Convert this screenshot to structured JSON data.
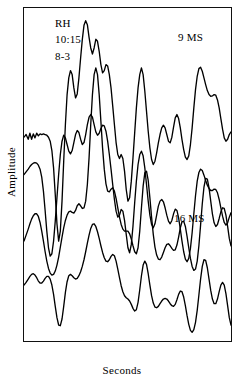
{
  "figure": {
    "background_color": "#ffffff",
    "line_color": "#000000",
    "axis_color": "#111111"
  },
  "annotations": {
    "subject": "RH",
    "time": "10:15",
    "code": "8-3",
    "group_1_label": "9 MS",
    "group_2_label": "16 MS"
  },
  "axes": {
    "xlabel": "Seconds",
    "ylabel": "Amplitude",
    "xticklabels": [
      "0.1",
      "0.2",
      "0.3",
      "0.4"
    ],
    "xtickvalues": [
      0.1,
      0.2,
      0.3,
      0.4
    ]
  },
  "chart_data": {
    "type": "line",
    "title": "",
    "subtitle": "",
    "xlabel": "Seconds",
    "ylabel": "Amplitude",
    "xlim": [
      0.0,
      0.49
    ],
    "ylim": [
      0,
      1
    ],
    "grid": false,
    "legend_position": "none",
    "annotations": [
      {
        "text": "RH",
        "x": 0.02,
        "y": 0.98
      },
      {
        "text": "10:15",
        "x": 0.02,
        "y": 0.93
      },
      {
        "text": "8-3",
        "x": 0.02,
        "y": 0.88
      },
      {
        "text": "9 MS",
        "x": 0.32,
        "y": 0.95
      },
      {
        "text": "16 MS",
        "x": 0.31,
        "y": 0.42
      }
    ],
    "axis_ranges": {
      "x": [
        0.0,
        0.49
      ],
      "y_arbitrary_units": true
    },
    "series": [
      {
        "name": "9 MS upper trace",
        "group": "9 MS",
        "x": [
          0.0,
          0.005,
          0.01,
          0.014,
          0.018,
          0.022,
          0.026,
          0.03,
          0.034,
          0.038,
          0.042,
          0.046,
          0.05,
          0.054,
          0.058,
          0.062,
          0.066,
          0.07,
          0.074,
          0.078,
          0.082,
          0.086,
          0.09,
          0.094,
          0.098,
          0.102,
          0.106,
          0.11,
          0.114,
          0.118,
          0.122,
          0.126,
          0.13,
          0.134,
          0.138,
          0.142,
          0.146,
          0.15,
          0.154,
          0.158,
          0.162,
          0.166,
          0.17,
          0.174,
          0.178,
          0.182,
          0.186,
          0.19,
          0.194,
          0.198,
          0.202,
          0.206,
          0.21,
          0.214,
          0.218,
          0.222,
          0.226,
          0.23,
          0.234,
          0.238,
          0.242,
          0.246,
          0.25,
          0.254,
          0.258,
          0.262,
          0.266,
          0.27,
          0.274,
          0.278,
          0.282,
          0.286,
          0.29,
          0.294,
          0.298,
          0.302,
          0.306,
          0.31,
          0.314,
          0.318,
          0.322,
          0.326,
          0.33,
          0.334,
          0.338,
          0.342,
          0.346,
          0.35,
          0.354,
          0.358,
          0.362,
          0.366,
          0.37,
          0.374,
          0.378,
          0.382,
          0.386,
          0.39,
          0.394,
          0.398,
          0.402,
          0.406,
          0.41,
          0.414,
          0.418,
          0.422,
          0.426,
          0.43,
          0.434,
          0.438,
          0.442,
          0.446,
          0.45,
          0.454,
          0.458,
          0.462,
          0.466,
          0.47,
          0.474,
          0.478,
          0.482,
          0.486,
          0.49
        ],
        "y": [
          0.612,
          0.62,
          0.606,
          0.624,
          0.606,
          0.622,
          0.61,
          0.624,
          0.616,
          0.622,
          0.62,
          0.622,
          0.62,
          0.618,
          0.612,
          0.6,
          0.572,
          0.52,
          0.44,
          0.352,
          0.3,
          0.33,
          0.42,
          0.54,
          0.65,
          0.74,
          0.79,
          0.812,
          0.8,
          0.76,
          0.73,
          0.742,
          0.79,
          0.85,
          0.905,
          0.948,
          0.962,
          0.95,
          0.912,
          0.88,
          0.862,
          0.88,
          0.906,
          0.9,
          0.87,
          0.83,
          0.805,
          0.812,
          0.83,
          0.826,
          0.8,
          0.76,
          0.706,
          0.65,
          0.596,
          0.56,
          0.548,
          0.56,
          0.548,
          0.51,
          0.455,
          0.42,
          0.43,
          0.48,
          0.55,
          0.625,
          0.7,
          0.76,
          0.8,
          0.82,
          0.8,
          0.75,
          0.69,
          0.63,
          0.58,
          0.545,
          0.53,
          0.54,
          0.565,
          0.595,
          0.62,
          0.64,
          0.648,
          0.64,
          0.62,
          0.6,
          0.595,
          0.612,
          0.642,
          0.67,
          0.68,
          0.668,
          0.64,
          0.605,
          0.575,
          0.552,
          0.545,
          0.556,
          0.59,
          0.64,
          0.7,
          0.755,
          0.795,
          0.818,
          0.822,
          0.81,
          0.79,
          0.77,
          0.752,
          0.74,
          0.735,
          0.736,
          0.74,
          0.738,
          0.724,
          0.7,
          0.668,
          0.636,
          0.61,
          0.6,
          0.606,
          0.62,
          0.628
        ]
      },
      {
        "name": "9 MS lower trace",
        "group": "9 MS",
        "x": [
          0.0,
          0.005,
          0.01,
          0.014,
          0.018,
          0.022,
          0.026,
          0.03,
          0.034,
          0.038,
          0.042,
          0.046,
          0.05,
          0.054,
          0.058,
          0.062,
          0.066,
          0.07,
          0.074,
          0.078,
          0.082,
          0.086,
          0.09,
          0.094,
          0.098,
          0.102,
          0.106,
          0.11,
          0.114,
          0.118,
          0.122,
          0.126,
          0.13,
          0.134,
          0.138,
          0.142,
          0.146,
          0.15,
          0.154,
          0.158,
          0.162,
          0.166,
          0.17,
          0.174,
          0.178,
          0.182,
          0.186,
          0.19,
          0.194,
          0.198,
          0.202,
          0.206,
          0.21,
          0.214,
          0.218,
          0.222,
          0.226,
          0.23,
          0.234,
          0.238,
          0.242,
          0.246,
          0.25,
          0.254,
          0.258,
          0.262,
          0.266,
          0.27,
          0.274,
          0.278,
          0.282,
          0.286,
          0.29,
          0.294,
          0.298,
          0.302,
          0.306,
          0.31,
          0.314,
          0.318,
          0.322,
          0.326,
          0.33,
          0.334,
          0.338,
          0.342,
          0.346,
          0.35,
          0.354,
          0.358,
          0.362,
          0.366,
          0.37,
          0.374,
          0.378,
          0.382,
          0.386,
          0.39,
          0.394,
          0.398,
          0.402,
          0.406,
          0.41,
          0.414,
          0.418,
          0.422,
          0.426,
          0.43,
          0.434,
          0.438,
          0.442,
          0.446,
          0.45,
          0.454,
          0.458,
          0.462,
          0.466,
          0.47,
          0.474,
          0.478,
          0.482,
          0.486,
          0.49
        ],
        "y": [
          0.5,
          0.508,
          0.516,
          0.524,
          0.53,
          0.534,
          0.536,
          0.534,
          0.528,
          0.516,
          0.492,
          0.45,
          0.392,
          0.33,
          0.28,
          0.255,
          0.262,
          0.3,
          0.36,
          0.43,
          0.5,
          0.56,
          0.6,
          0.618,
          0.61,
          0.59,
          0.57,
          0.562,
          0.572,
          0.596,
          0.62,
          0.632,
          0.626,
          0.606,
          0.59,
          0.596,
          0.62,
          0.65,
          0.672,
          0.68,
          0.672,
          0.65,
          0.628,
          0.618,
          0.624,
          0.638,
          0.648,
          0.646,
          0.63,
          0.6,
          0.56,
          0.516,
          0.47,
          0.425,
          0.39,
          0.372,
          0.378,
          0.395,
          0.39,
          0.362,
          0.32,
          0.28,
          0.265,
          0.29,
          0.345,
          0.415,
          0.48,
          0.53,
          0.56,
          0.57,
          0.556,
          0.52,
          0.47,
          0.42,
          0.378,
          0.35,
          0.34,
          0.352,
          0.378,
          0.405,
          0.42,
          0.425,
          0.418,
          0.4,
          0.378,
          0.36,
          0.352,
          0.362,
          0.382,
          0.396,
          0.392,
          0.37,
          0.336,
          0.3,
          0.268,
          0.246,
          0.238,
          0.248,
          0.278,
          0.325,
          0.382,
          0.436,
          0.48,
          0.506,
          0.516,
          0.512,
          0.498,
          0.482,
          0.468,
          0.458,
          0.452,
          0.452,
          0.456,
          0.455,
          0.445,
          0.425,
          0.4,
          0.375,
          0.356,
          0.348,
          0.355,
          0.372,
          0.385
        ]
      },
      {
        "name": "16 MS upper trace",
        "group": "16 MS",
        "x": [
          0.0,
          0.005,
          0.01,
          0.014,
          0.018,
          0.022,
          0.026,
          0.03,
          0.034,
          0.038,
          0.042,
          0.046,
          0.05,
          0.054,
          0.058,
          0.062,
          0.066,
          0.07,
          0.074,
          0.078,
          0.082,
          0.086,
          0.09,
          0.094,
          0.098,
          0.102,
          0.106,
          0.11,
          0.114,
          0.118,
          0.122,
          0.126,
          0.13,
          0.134,
          0.138,
          0.142,
          0.146,
          0.15,
          0.154,
          0.158,
          0.162,
          0.166,
          0.17,
          0.174,
          0.178,
          0.182,
          0.186,
          0.19,
          0.194,
          0.198,
          0.202,
          0.206,
          0.21,
          0.214,
          0.218,
          0.222,
          0.226,
          0.23,
          0.234,
          0.238,
          0.242,
          0.246,
          0.25,
          0.254,
          0.258,
          0.262,
          0.266,
          0.27,
          0.274,
          0.278,
          0.282,
          0.286,
          0.29,
          0.294,
          0.298,
          0.302,
          0.306,
          0.31,
          0.314,
          0.318,
          0.322,
          0.326,
          0.33,
          0.334,
          0.338,
          0.342,
          0.346,
          0.35,
          0.354,
          0.358,
          0.362,
          0.366,
          0.37,
          0.374,
          0.378,
          0.382,
          0.386,
          0.39,
          0.394,
          0.398,
          0.402,
          0.406,
          0.41,
          0.414,
          0.418,
          0.422,
          0.426,
          0.43,
          0.434,
          0.438,
          0.442,
          0.446,
          0.45,
          0.454,
          0.458,
          0.462,
          0.466,
          0.47,
          0.474,
          0.478,
          0.482,
          0.486,
          0.49
        ],
        "y": [
          0.3,
          0.318,
          0.336,
          0.352,
          0.366,
          0.376,
          0.382,
          0.382,
          0.374,
          0.356,
          0.33,
          0.3,
          0.268,
          0.24,
          0.218,
          0.204,
          0.198,
          0.2,
          0.21,
          0.228,
          0.252,
          0.282,
          0.312,
          0.34,
          0.362,
          0.378,
          0.388,
          0.39,
          0.386,
          0.384,
          0.392,
          0.406,
          0.412,
          0.406,
          0.398,
          0.4,
          0.42,
          0.47,
          0.55,
          0.65,
          0.74,
          0.8,
          0.82,
          0.8,
          0.74,
          0.66,
          0.58,
          0.516,
          0.472,
          0.45,
          0.448,
          0.456,
          0.46,
          0.45,
          0.428,
          0.4,
          0.372,
          0.35,
          0.336,
          0.33,
          0.33,
          0.33,
          0.322,
          0.306,
          0.286,
          0.268,
          0.262,
          0.28,
          0.33,
          0.4,
          0.465,
          0.505,
          0.51,
          0.482,
          0.43,
          0.372,
          0.32,
          0.282,
          0.258,
          0.246,
          0.244,
          0.252,
          0.266,
          0.28,
          0.29,
          0.292,
          0.286,
          0.278,
          0.272,
          0.274,
          0.288,
          0.312,
          0.34,
          0.358,
          0.36,
          0.344,
          0.314,
          0.28,
          0.248,
          0.224,
          0.212,
          0.216,
          0.24,
          0.286,
          0.348,
          0.412,
          0.462,
          0.488,
          0.486,
          0.46,
          0.42,
          0.382,
          0.355,
          0.344,
          0.35,
          0.368,
          0.388,
          0.4,
          0.398,
          0.378,
          0.344,
          0.308,
          0.286
        ]
      },
      {
        "name": "16 MS lower trace",
        "group": "16 MS",
        "x": [
          0.0,
          0.005,
          0.01,
          0.014,
          0.018,
          0.022,
          0.026,
          0.03,
          0.034,
          0.038,
          0.042,
          0.046,
          0.05,
          0.054,
          0.058,
          0.062,
          0.066,
          0.07,
          0.074,
          0.078,
          0.082,
          0.086,
          0.09,
          0.094,
          0.098,
          0.102,
          0.106,
          0.11,
          0.114,
          0.118,
          0.122,
          0.126,
          0.13,
          0.134,
          0.138,
          0.142,
          0.146,
          0.15,
          0.154,
          0.158,
          0.162,
          0.166,
          0.17,
          0.174,
          0.178,
          0.182,
          0.186,
          0.19,
          0.194,
          0.198,
          0.202,
          0.206,
          0.21,
          0.214,
          0.218,
          0.222,
          0.226,
          0.23,
          0.234,
          0.238,
          0.242,
          0.246,
          0.25,
          0.254,
          0.258,
          0.262,
          0.266,
          0.27,
          0.274,
          0.278,
          0.282,
          0.286,
          0.29,
          0.294,
          0.298,
          0.302,
          0.306,
          0.31,
          0.314,
          0.318,
          0.322,
          0.326,
          0.33,
          0.334,
          0.338,
          0.342,
          0.346,
          0.35,
          0.354,
          0.358,
          0.362,
          0.366,
          0.37,
          0.374,
          0.378,
          0.382,
          0.386,
          0.39,
          0.394,
          0.398,
          0.402,
          0.406,
          0.41,
          0.414,
          0.418,
          0.422,
          0.426,
          0.43,
          0.434,
          0.438,
          0.442,
          0.446,
          0.45,
          0.454,
          0.458,
          0.462,
          0.466,
          0.47,
          0.474,
          0.478,
          0.482,
          0.486,
          0.49
        ],
        "y": [
          0.168,
          0.176,
          0.186,
          0.194,
          0.2,
          0.202,
          0.198,
          0.19,
          0.18,
          0.174,
          0.174,
          0.18,
          0.188,
          0.194,
          0.194,
          0.186,
          0.168,
          0.14,
          0.104,
          0.07,
          0.048,
          0.046,
          0.066,
          0.104,
          0.146,
          0.178,
          0.196,
          0.2,
          0.196,
          0.19,
          0.186,
          0.188,
          0.196,
          0.208,
          0.224,
          0.244,
          0.268,
          0.294,
          0.318,
          0.338,
          0.35,
          0.352,
          0.344,
          0.328,
          0.308,
          0.286,
          0.266,
          0.25,
          0.24,
          0.238,
          0.244,
          0.254,
          0.26,
          0.256,
          0.24,
          0.216,
          0.19,
          0.166,
          0.148,
          0.136,
          0.13,
          0.126,
          0.12,
          0.11,
          0.098,
          0.09,
          0.094,
          0.116,
          0.154,
          0.196,
          0.228,
          0.24,
          0.23,
          0.202,
          0.168,
          0.136,
          0.114,
          0.102,
          0.1,
          0.104,
          0.112,
          0.12,
          0.126,
          0.128,
          0.126,
          0.12,
          0.112,
          0.106,
          0.104,
          0.11,
          0.124,
          0.14,
          0.15,
          0.148,
          0.132,
          0.106,
          0.076,
          0.05,
          0.032,
          0.026,
          0.034,
          0.056,
          0.092,
          0.138,
          0.186,
          0.224,
          0.244,
          0.242,
          0.22,
          0.186,
          0.152,
          0.126,
          0.112,
          0.112,
          0.126,
          0.148,
          0.168,
          0.176,
          0.168,
          0.142,
          0.106,
          0.07,
          0.048
        ]
      }
    ]
  }
}
